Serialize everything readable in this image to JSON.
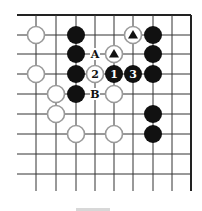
{
  "diagram": {
    "type": "go-board-fragment",
    "grid": {
      "columns_x": [
        36,
        56,
        76,
        95,
        114,
        133,
        153,
        172,
        191
      ],
      "rows_y": [
        15,
        35,
        54,
        74,
        94,
        114,
        134,
        154,
        174
      ],
      "line_left_x": 17,
      "line_bottom_y": 191,
      "top_edge": true,
      "right_edge": true,
      "line_color": "#333333",
      "edge_color": "#222222"
    },
    "stone_radius": 9,
    "colors": {
      "black_stone": "#111111",
      "white_stone_fill": "#ffffff",
      "white_stone_border": "#9a9a9a",
      "marker_on_white": "#111111",
      "number_on_black": "#ffffff",
      "number_on_white": "#111111",
      "label_text": "#111111"
    },
    "stones": [
      {
        "color": "white",
        "col": 0,
        "row": 1,
        "label": ""
      },
      {
        "color": "black",
        "col": 2,
        "row": 1,
        "label": ""
      },
      {
        "color": "white",
        "col": 5,
        "row": 1,
        "label": "",
        "marker": "triangle"
      },
      {
        "color": "black",
        "col": 6,
        "row": 1,
        "label": ""
      },
      {
        "color": "black",
        "col": 2,
        "row": 2,
        "label": ""
      },
      {
        "color": "white",
        "col": 4,
        "row": 2,
        "label": "",
        "marker": "triangle"
      },
      {
        "color": "black",
        "col": 6,
        "row": 2,
        "label": ""
      },
      {
        "color": "white",
        "col": 0,
        "row": 3,
        "label": ""
      },
      {
        "color": "black",
        "col": 2,
        "row": 3,
        "label": ""
      },
      {
        "color": "white",
        "col": 3,
        "row": 3,
        "label": "2"
      },
      {
        "color": "black",
        "col": 4,
        "row": 3,
        "label": "1"
      },
      {
        "color": "black",
        "col": 5,
        "row": 3,
        "label": "3"
      },
      {
        "color": "black",
        "col": 6,
        "row": 3,
        "label": ""
      },
      {
        "color": "white",
        "col": 1,
        "row": 4,
        "label": ""
      },
      {
        "color": "black",
        "col": 2,
        "row": 4,
        "label": ""
      },
      {
        "color": "white",
        "col": 4,
        "row": 4,
        "label": ""
      },
      {
        "color": "white",
        "col": 1,
        "row": 5,
        "label": ""
      },
      {
        "color": "black",
        "col": 6,
        "row": 5,
        "label": ""
      },
      {
        "color": "white",
        "col": 2,
        "row": 6,
        "label": ""
      },
      {
        "color": "white",
        "col": 4,
        "row": 6,
        "label": ""
      },
      {
        "color": "black",
        "col": 6,
        "row": 6,
        "label": ""
      }
    ],
    "point_labels": [
      {
        "text": "A",
        "col": 3,
        "row": 2
      },
      {
        "text": "B",
        "col": 3,
        "row": 4
      }
    ]
  }
}
